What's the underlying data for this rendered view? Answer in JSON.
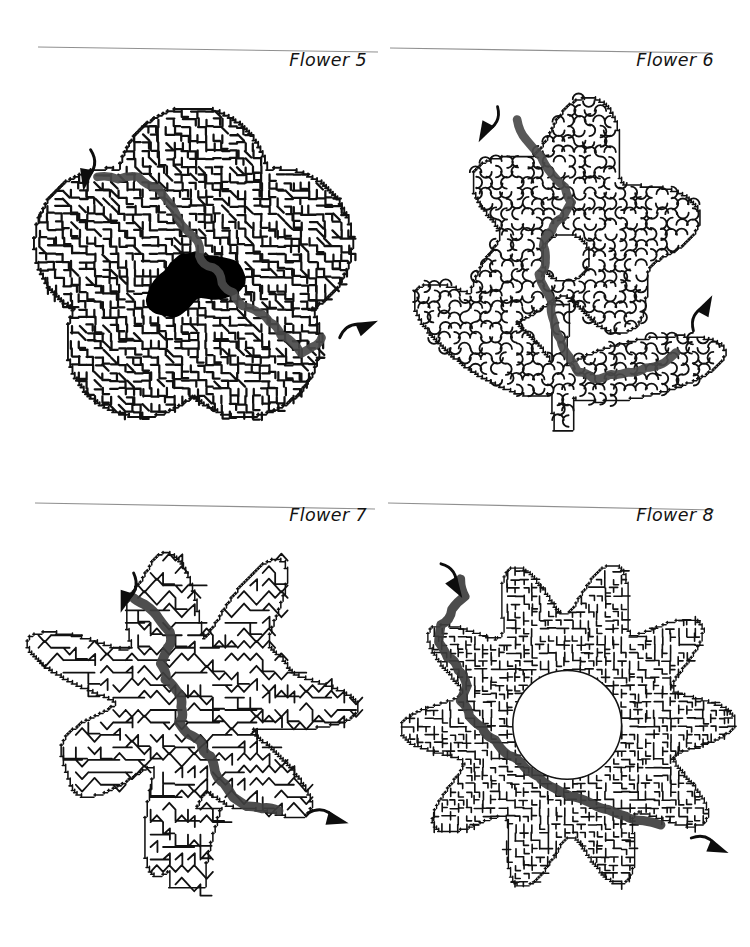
{
  "page": {
    "background": "#ffffff",
    "ink": "#111111",
    "rule_color": "#8f8f8f",
    "solution_color": "#4a4a4a",
    "panel_count": 4
  },
  "panels": [
    {
      "id": "flower-5",
      "caption": "Flower 5",
      "caption_align": "right",
      "rule": {
        "x1": 38,
        "y1": 19,
        "x2": 378,
        "y2": 24,
        "color": "#909090",
        "width": 1.1
      },
      "maze": {
        "style": "angular-dense",
        "shape": "five-petal-blossom",
        "wall_color": "#111111",
        "wall_width": 2.0,
        "cell": 7.0,
        "center_fill": "#000000",
        "center_shape": "heart-blob",
        "has_filled_center": true,
        "has_hole": false,
        "stem": false,
        "seed": 1735
      },
      "solution": {
        "color": "#4a4a4a",
        "width": 7.5,
        "entry_arrow": {
          "x": 80,
          "y": 62,
          "angle": 100,
          "direction": "down-right"
        },
        "exit_arrow": {
          "x": 300,
          "y": 228,
          "angle": -24,
          "direction": "up-right"
        },
        "waypoints": [
          [
            86,
            86
          ],
          [
            104,
            88
          ],
          [
            122,
            86
          ],
          [
            140,
            96
          ],
          [
            152,
            112
          ],
          [
            160,
            128
          ],
          [
            172,
            140
          ],
          [
            176,
            156
          ],
          [
            188,
            166
          ],
          [
            196,
            180
          ],
          [
            206,
            188
          ],
          [
            214,
            200
          ],
          [
            228,
            206
          ],
          [
            238,
            214
          ],
          [
            248,
            226
          ],
          [
            258,
            232
          ],
          [
            266,
            242
          ],
          [
            276,
            236
          ],
          [
            284,
            228
          ]
        ]
      }
    },
    {
      "id": "flower-6",
      "caption": "Flower 6",
      "caption_align": "right",
      "rule": {
        "x1": 10,
        "y1": 20,
        "x2": 332,
        "y2": 25,
        "color": "#909090",
        "width": 1.1
      },
      "maze": {
        "style": "bubbly-round",
        "shape": "bloom-with-stem-and-leaves",
        "wall_color": "#161616",
        "wall_width": 1.7,
        "cell": 9.5,
        "center_fill": "#ffffff",
        "center_shape": "round-hole",
        "has_filled_center": false,
        "has_hole": true,
        "stem": true,
        "leaves": 2,
        "seed": 2460
      },
      "solution": {
        "color": "#4a4a4a",
        "width": 8.0,
        "entry_arrow": {
          "x": 108,
          "y": 18,
          "angle": 118,
          "direction": "down-right"
        },
        "exit_arrow": {
          "x": 288,
          "y": 224,
          "angle": -62,
          "direction": "up-right"
        },
        "waypoints": [
          [
            126,
            30
          ],
          [
            134,
            48
          ],
          [
            148,
            64
          ],
          [
            158,
            80
          ],
          [
            170,
            92
          ],
          [
            176,
            106
          ],
          [
            168,
            120
          ],
          [
            158,
            132
          ],
          [
            150,
            146
          ],
          [
            152,
            160
          ],
          [
            146,
            172
          ],
          [
            152,
            186
          ],
          [
            158,
            200
          ],
          [
            160,
            216
          ],
          [
            166,
            232
          ],
          [
            174,
            248
          ],
          [
            182,
            262
          ],
          [
            196,
            268
          ],
          [
            212,
            264
          ],
          [
            228,
            262
          ],
          [
            244,
            258
          ],
          [
            260,
            254
          ],
          [
            272,
            244
          ]
        ]
      }
    },
    {
      "id": "flower-7",
      "caption": "Flower 7",
      "caption_align": "right",
      "rule": {
        "x1": 35,
        "y1": 20,
        "x2": 375,
        "y2": 26,
        "color": "#909090",
        "width": 1.1
      },
      "maze": {
        "style": "spiky-zigzag",
        "shape": "starburst-bloom-with-stem",
        "wall_color": "#111111",
        "wall_width": 1.6,
        "cell": 11.0,
        "center_fill": "#ffffff",
        "center_shape": "none",
        "has_filled_center": false,
        "has_hole": false,
        "stem": true,
        "seed": 3310
      },
      "solution": {
        "color": "#3f3f3f",
        "width": 8.5,
        "entry_arrow": {
          "x": 118,
          "y": 34,
          "angle": 108,
          "direction": "down-right"
        },
        "exit_arrow": {
          "x": 272,
          "y": 246,
          "angle": 14,
          "direction": "down-right"
        },
        "waypoints": [
          [
            118,
            56
          ],
          [
            128,
            62
          ],
          [
            140,
            74
          ],
          [
            150,
            86
          ],
          [
            148,
            100
          ],
          [
            142,
            114
          ],
          [
            146,
            128
          ],
          [
            156,
            138
          ],
          [
            160,
            152
          ],
          [
            158,
            166
          ],
          [
            166,
            176
          ],
          [
            178,
            184
          ],
          [
            186,
            196
          ],
          [
            190,
            210
          ],
          [
            198,
            220
          ],
          [
            206,
            232
          ],
          [
            218,
            240
          ],
          [
            232,
            242
          ],
          [
            246,
            244
          ]
        ]
      }
    },
    {
      "id": "flower-8",
      "caption": "Flower 8",
      "caption_align": "right",
      "rule": {
        "x1": 8,
        "y1": 20,
        "x2": 334,
        "y2": 27,
        "color": "#909090",
        "width": 1.1
      },
      "maze": {
        "style": "organic-dense",
        "shape": "daisy-ten-petal-ring",
        "wall_color": "#141414",
        "wall_width": 1.5,
        "cell": 7.5,
        "center_fill": "#ffffff",
        "center_shape": "round-hole",
        "has_filled_center": false,
        "has_hole": true,
        "stem": false,
        "petals": 10,
        "seed": 4821
      },
      "solution": {
        "color": "#3d3d3d",
        "width": 8.5,
        "entry_arrow": {
          "x": 56,
          "y": 20,
          "angle": 58,
          "direction": "down-right"
        },
        "exit_arrow": {
          "x": 286,
          "y": 272,
          "angle": 22,
          "direction": "down-right"
        },
        "waypoints": [
          [
            74,
            34
          ],
          [
            78,
            50
          ],
          [
            66,
            62
          ],
          [
            56,
            76
          ],
          [
            54,
            92
          ],
          [
            62,
            106
          ],
          [
            72,
            118
          ],
          [
            80,
            132
          ],
          [
            74,
            146
          ],
          [
            82,
            160
          ],
          [
            94,
            170
          ],
          [
            106,
            182
          ],
          [
            118,
            196
          ],
          [
            132,
            206
          ],
          [
            146,
            216
          ],
          [
            160,
            226
          ],
          [
            176,
            234
          ],
          [
            194,
            240
          ],
          [
            210,
            246
          ],
          [
            226,
            252
          ],
          [
            242,
            256
          ],
          [
            258,
            260
          ]
        ]
      }
    }
  ]
}
